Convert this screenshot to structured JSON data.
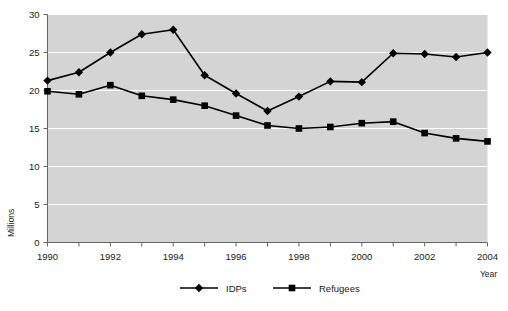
{
  "chart_data": {
    "type": "line",
    "title": "",
    "xlabel": "Year",
    "ylabel": "Millions",
    "x": [
      1990,
      1991,
      1992,
      1993,
      1994,
      1995,
      1996,
      1997,
      1998,
      1999,
      2000,
      2001,
      2002,
      2003,
      2004
    ],
    "xlim": [
      1990,
      2004
    ],
    "ylim": [
      0,
      30
    ],
    "yticks": [
      0,
      5,
      10,
      15,
      20,
      25,
      30
    ],
    "ytick_labels": [
      "0",
      "5",
      "10",
      "15",
      "20",
      "25",
      "30"
    ],
    "xtick_labels": [
      "1990",
      "",
      "1992",
      "",
      "1994",
      "",
      "1996",
      "",
      "1998",
      "",
      "2000",
      "",
      "2002",
      "",
      "2004"
    ],
    "grid": "horizontal-white",
    "legend_position": "bottom-center",
    "series": [
      {
        "name": "IDPs",
        "marker": "diamond",
        "color": "#000000",
        "values": [
          21.3,
          22.4,
          25.0,
          27.4,
          28.0,
          22.0,
          19.6,
          17.3,
          19.2,
          21.2,
          21.1,
          24.9,
          24.8,
          24.4,
          25.0
        ]
      },
      {
        "name": "Refugees",
        "marker": "square",
        "color": "#000000",
        "values": [
          19.9,
          19.5,
          20.7,
          19.3,
          18.8,
          18.0,
          16.7,
          15.4,
          15.0,
          15.2,
          15.7,
          15.9,
          14.4,
          13.7,
          13.3
        ]
      }
    ],
    "plot_background": "#d4d4d4",
    "gridline_color": "#ffffff",
    "axis_color": "#666666"
  }
}
